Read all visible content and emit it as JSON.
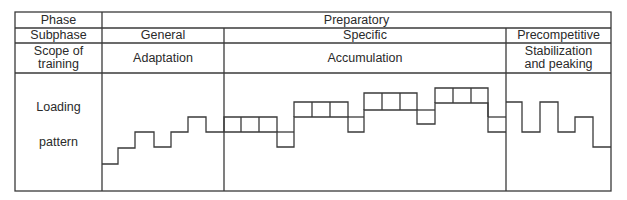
{
  "table": {
    "row_labels": {
      "phase": "Phase",
      "subphase": "Subphase",
      "scope": "Scope of training",
      "scope_line1": "Scope of",
      "scope_line2": "training",
      "loading_line1": "Loading",
      "loading_line2": "pattern"
    },
    "phase": {
      "preparatory": "Preparatory"
    },
    "subphases": {
      "general": "General",
      "specific": "Specific",
      "precompetitive": "Precompetitive"
    },
    "scopes": {
      "adaptation": "Adaptation",
      "accumulation": "Accumulation",
      "stabilization_line1": "Stabilization",
      "stabilization_line2": "and peaking"
    }
  },
  "loading_pattern": {
    "description": "Step-like loading pattern per subphase",
    "general": [
      1,
      2,
      3,
      2,
      3,
      4,
      3
    ],
    "specific": [
      3,
      3,
      3,
      2,
      4,
      4,
      4,
      3,
      5,
      5,
      5,
      4,
      6,
      6,
      6,
      3
    ],
    "precompetitive": [
      4,
      2,
      4,
      2,
      3,
      1
    ]
  },
  "colors": {
    "line": "#3a3a3a",
    "background": "#ffffff"
  }
}
